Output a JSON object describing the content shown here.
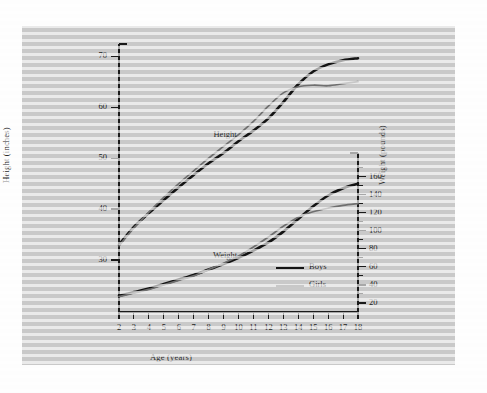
{
  "figure": {
    "margin_note": ""
  },
  "chart_data": {
    "type": "line",
    "title": "",
    "xlabel": "Age (years)",
    "ylabel": "Height (inches)",
    "ylabel_right": "Weight (pounds)",
    "xlim": [
      2,
      18
    ],
    "ylim_height": [
      20,
      72
    ],
    "ylim_weight": [
      10,
      175
    ],
    "grid": false,
    "legend_position": "inside-lower-right",
    "x": [
      2,
      3,
      4,
      5,
      6,
      7,
      8,
      9,
      10,
      11,
      12,
      13,
      14,
      15,
      16,
      17,
      18
    ],
    "xticks": [
      2,
      3,
      4,
      5,
      6,
      7,
      8,
      9,
      10,
      11,
      12,
      13,
      14,
      15,
      16,
      17,
      18
    ],
    "xticklabels": [
      "2",
      "3",
      "4",
      "5",
      "6",
      "7",
      "8",
      "9",
      "10",
      "11",
      "12",
      "13",
      "14",
      "15",
      "16",
      "17",
      "18"
    ],
    "yticks_height": [
      30,
      40,
      50,
      60,
      70
    ],
    "yticklabels_height": [
      "30",
      "40",
      "50",
      "60",
      "70"
    ],
    "yticks_weight": [
      20,
      40,
      60,
      80,
      100,
      120,
      140,
      160
    ],
    "yticklabels_weight": [
      "20",
      "40",
      "60",
      "80",
      "100",
      "120",
      "140",
      "160"
    ],
    "yticks_weight_minor": [
      30,
      50,
      70,
      90,
      110,
      130,
      150,
      170
    ],
    "annotations": [
      {
        "text": "Height",
        "x": 9.1,
        "y_axis": "height",
        "y": 54.5
      },
      {
        "text": "Weight",
        "x": 9.1,
        "y_axis": "weight",
        "y": 72
      }
    ],
    "legend": [
      {
        "name": "Boys",
        "color": "#141414",
        "width": 2.6
      },
      {
        "name": "Girls",
        "color": "#6f6f6f",
        "width": 1.7
      }
    ],
    "series": [
      {
        "name": "Boys",
        "measure": "Height",
        "unit": "inches",
        "axis": "left",
        "color": "#141414",
        "values": [
          33.0,
          36.5,
          39.2,
          41.8,
          44.3,
          46.7,
          49.0,
          51.0,
          53.3,
          55.4,
          57.8,
          61.0,
          64.5,
          67.0,
          68.4,
          69.2,
          69.6
        ]
      },
      {
        "name": "Girls",
        "measure": "Height",
        "unit": "inches",
        "axis": "left",
        "color": "#6f6f6f",
        "values": [
          32.8,
          36.3,
          39.4,
          42.3,
          45.0,
          47.5,
          50.0,
          52.3,
          54.6,
          57.2,
          60.2,
          62.8,
          64.0,
          64.3,
          64.2,
          64.6,
          65.0
        ]
      },
      {
        "name": "Boys",
        "measure": "Weight",
        "unit": "pounds",
        "axis": "right",
        "color": "#141414",
        "values": [
          28,
          32,
          36,
          41,
          46,
          51,
          57,
          63,
          70,
          78,
          87,
          99,
          113,
          127,
          139,
          147,
          152
        ]
      },
      {
        "name": "Girls",
        "measure": "Weight",
        "unit": "pounds",
        "axis": "right",
        "color": "#6f6f6f",
        "values": [
          27,
          31,
          35,
          40,
          45,
          50,
          57,
          64,
          72,
          82,
          93,
          105,
          115,
          121,
          125,
          128,
          130
        ]
      }
    ]
  }
}
